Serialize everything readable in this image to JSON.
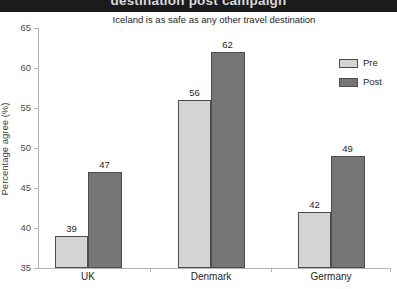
{
  "banner": {
    "title": "destination post campaign",
    "bg_color": "#1b1b1b",
    "text_color": "#d9d9d9"
  },
  "chart_data": {
    "type": "bar",
    "title": "Iceland is as safe as any other travel destination",
    "xlabel": "",
    "ylabel": "Percentage agree (%)",
    "categories": [
      "UK",
      "Denmark",
      "Germany"
    ],
    "series": [
      {
        "name": "Pre",
        "color": "#d4d4d4",
        "values": [
          39,
          56,
          42
        ]
      },
      {
        "name": "Post",
        "color": "#767676",
        "values": [
          47,
          62,
          49
        ]
      }
    ],
    "ylim": [
      35,
      65
    ],
    "yticks": [
      35,
      40,
      45,
      50,
      55,
      60,
      65
    ],
    "grid": false,
    "legend_position": "top-right",
    "bar_border_color": "#4d4d4d",
    "axis_color": "#b3b3b3"
  }
}
